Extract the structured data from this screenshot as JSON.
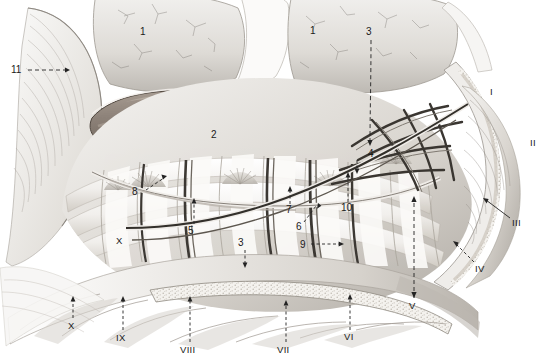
{
  "figure": {
    "kind": "anatomical-illustration",
    "style": "grayscale pencil/wash medical drawing",
    "background_color": "#ffffff",
    "ink_color": "#1a1a1a"
  },
  "palette": {
    "paper": "#ffffff",
    "tissue_light": "#e9e7e4",
    "tissue_mid": "#cfccc8",
    "tissue_dark": "#9a9692",
    "vessel_tube": "#8d8279",
    "vessel_tube_shadow": "#6e645c",
    "vessel_dark": "#4a4642",
    "rib_pale": "#f3f2f0",
    "marrow_speckle": "#d8d4cd",
    "outline": "#2b2b2b",
    "leader": "#232323"
  },
  "numeric_labels": [
    {
      "id": "1",
      "text": "1",
      "x": 143,
      "y": 32,
      "leader": "none"
    },
    {
      "id": "1b",
      "text": "1",
      "x": 313,
      "y": 31,
      "leader": "none"
    },
    {
      "id": "2",
      "text": "2",
      "x": 214,
      "y": 135,
      "leader": "none"
    },
    {
      "id": "3",
      "text": "3",
      "x": 368,
      "y": 32,
      "leader": "dashed-down",
      "leader_len": 108
    },
    {
      "id": "3b",
      "text": "3",
      "x": 241,
      "y": 243,
      "leader": "dashed-down",
      "leader_len": 24
    },
    {
      "id": "4",
      "text": "4",
      "x": 371,
      "y": 154,
      "leader": "dashed-down",
      "leader_len": 16
    },
    {
      "id": "5",
      "text": "5",
      "x": 190,
      "y": 231,
      "leader": "dashed-up",
      "leader_len": 27
    },
    {
      "id": "6",
      "text": "6",
      "x": 299,
      "y": 228,
      "leader": "dashed-diag-up-right"
    },
    {
      "id": "7",
      "text": "7",
      "x": 289,
      "y": 211,
      "leader": "dashed-up",
      "leader_len": 22
    },
    {
      "id": "8",
      "text": "8",
      "x": 135,
      "y": 193,
      "leader": "dashed-diag-up-right"
    },
    {
      "id": "9",
      "text": "9",
      "x": 303,
      "y": 247,
      "leader": "dashed-right",
      "leader_len": 38
    },
    {
      "id": "10",
      "text": "10",
      "x": 345,
      "y": 209,
      "leader": "dashed-up",
      "leader_len": 30
    },
    {
      "id": "11",
      "text": "11",
      "x": 12,
      "y": 70,
      "leader": "dashed-right",
      "leader_len": 50
    }
  ],
  "roman_labels": [
    {
      "id": "I",
      "text": "I",
      "x": 492,
      "y": 92,
      "leader": "none"
    },
    {
      "id": "II",
      "text": "II",
      "x": 534,
      "y": 143,
      "leader": "none"
    },
    {
      "id": "III",
      "text": "III",
      "x": 514,
      "y": 223,
      "leader": "solid-diag-up-left"
    },
    {
      "id": "IV",
      "text": "IV",
      "x": 477,
      "y": 269,
      "leader": "solid-diag-up-left"
    },
    {
      "id": "V",
      "text": "V",
      "x": 411,
      "y": 306,
      "leader": "dashed-up",
      "leader_len": 110
    },
    {
      "id": "VI",
      "text": "VI",
      "x": 346,
      "y": 337,
      "leader": "dashed-up",
      "leader_len": 42
    },
    {
      "id": "VII",
      "text": "VII",
      "x": 279,
      "y": 350,
      "leader": "dashed-up",
      "leader_len": 48
    },
    {
      "id": "VIII",
      "text": "VIII",
      "x": 182,
      "y": 350,
      "leader": "dashed-up",
      "leader_len": 48
    },
    {
      "id": "IX",
      "text": "IX",
      "x": 118,
      "y": 339,
      "leader": "dashed-up",
      "leader_len": 38
    },
    {
      "id": "X",
      "text": "X",
      "x": 69,
      "y": 327,
      "leader": "dashed-up",
      "leader_len": 28
    },
    {
      "id": "Xb",
      "text": "X",
      "x": 118,
      "y": 241,
      "leader": "none"
    }
  ]
}
